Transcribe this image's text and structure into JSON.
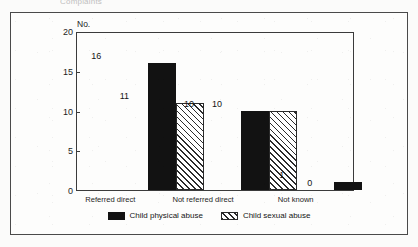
{
  "top_caption": "Complaints",
  "chart_data": {
    "type": "bar",
    "title": "",
    "xlabel": "",
    "ylabel": "No.",
    "ylim": [
      0,
      20
    ],
    "yticks": [
      0,
      5,
      10,
      15,
      20
    ],
    "ytick_labels": [
      "0",
      "5",
      "10",
      "15",
      "20"
    ],
    "grid": false,
    "legend_position": "bottom-center",
    "categories": [
      "Referred direct",
      "Not referred direct",
      "Not known"
    ],
    "series": [
      {
        "name": "Child physical abuse",
        "fill": "solid-black",
        "color": "#121212",
        "values": [
          16,
          10,
          1
        ],
        "value_labels": [
          "16",
          "10",
          "1"
        ]
      },
      {
        "name": "Child sexual abuse",
        "fill": "diagonal-hatch",
        "color": "#2b2b2b",
        "values": [
          11,
          10,
          0
        ],
        "value_labels": [
          "11",
          "10",
          "0"
        ]
      }
    ]
  },
  "axis": {
    "unit_label": "No."
  },
  "legend": {
    "entries": [
      {
        "label": "Child physical abuse",
        "swatch": "solid-swatch"
      },
      {
        "label": "Child sexual abuse",
        "swatch": "hatched-swatch"
      }
    ]
  },
  "colors": {
    "frame": "#4a4a4a",
    "axis": "#3b3b3b",
    "series_1": "#121212",
    "series_2": "#2b2b2b",
    "background": "#fdfdfc"
  }
}
